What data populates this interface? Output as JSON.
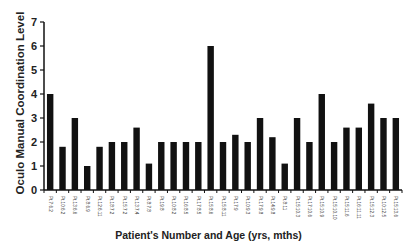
{
  "chart_data": {
    "type": "bar",
    "title": "",
    "xlabel": "Patient's Number and Age (yrs, mths)",
    "ylabel": "Oculo Manual Coordination Level",
    "ylim": [
      0,
      7
    ],
    "yticks": [
      0,
      1,
      2,
      3,
      4,
      5,
      6,
      7
    ],
    "grid": false,
    "legend": null,
    "categories": [
      "Pt.7:6.2",
      "Pt.10:6.2",
      "Pt.13:6.6",
      "Pt.8:6.9",
      "Pt.12:6.11",
      "Pt.18:7.2",
      "Pt.15:7.2",
      "Pt.13:7.4",
      "Pt.8:7.8",
      "Pt.19:8",
      "Pt.10:8.2",
      "Pt.16:8.5",
      "Pt.17:8.5",
      "Pt.15:8.6",
      "Pt.15:8.11",
      "Pt.17:9",
      "Pt.10:9.3",
      "Pt.17:9.8",
      "Pt.14:9.8",
      "Pt.8:11",
      "Pt.15:10.3",
      "Pt.17:10.6",
      "Pt.15:10.9",
      "Pt.15:10.10",
      "Pt.15:11.6",
      "Pt.16:11.11",
      "Pt.15:12.3",
      "Pt.10:12.5",
      "Pt.15:13.6"
    ],
    "values": [
      4,
      1.8,
      3,
      1,
      1.8,
      2,
      2,
      2.6,
      1.1,
      2,
      2,
      2,
      2,
      6,
      2,
      2.3,
      2,
      3,
      2.2,
      1.1,
      3,
      2,
      4,
      2,
      2.6,
      2.6,
      3.6,
      3,
      3
    ],
    "bar_color": "#111111"
  },
  "axis": {
    "xlabel": "Patient's Number and Age (yrs, mths)",
    "ylabel": "Oculo Manual Coordination Level"
  }
}
